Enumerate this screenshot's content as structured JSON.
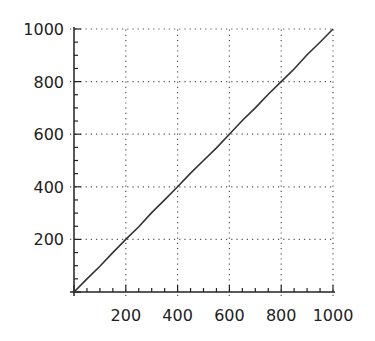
{
  "chart_data": {
    "type": "line",
    "title": "",
    "xlabel": "",
    "ylabel": "",
    "xlim": [
      0,
      1000
    ],
    "ylim": [
      0,
      1000
    ],
    "grid": true,
    "grid_style": "dotted",
    "legend": null,
    "x_ticks": [
      200,
      400,
      600,
      800,
      1000
    ],
    "y_ticks": [
      200,
      400,
      600,
      800,
      1000
    ],
    "x_tick_labels": [
      "200",
      "400",
      "600",
      "800",
      "1000"
    ],
    "y_tick_labels": [
      "200",
      "400",
      "600",
      "800",
      "1000"
    ],
    "series": [
      {
        "name": "series",
        "color": "#333333",
        "x": [
          0,
          50,
          100,
          150,
          200,
          250,
          300,
          350,
          400,
          450,
          500,
          550,
          600,
          650,
          700,
          750,
          800,
          850,
          900,
          950,
          1000
        ],
        "y": [
          0,
          50,
          98,
          150,
          200,
          248,
          302,
          350,
          400,
          452,
          500,
          548,
          600,
          652,
          700,
          752,
          800,
          848,
          902,
          950,
          1000
        ]
      }
    ]
  },
  "colors": {
    "axis": "#222222",
    "grid": "#555555",
    "line": "#333333"
  }
}
